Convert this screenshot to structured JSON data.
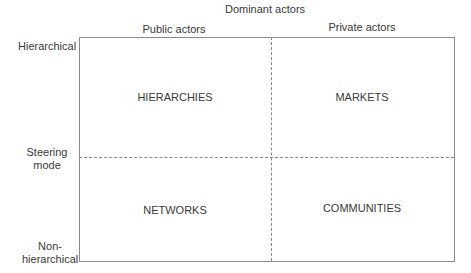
{
  "diagram": {
    "top_title": "Dominant actors",
    "columns": [
      {
        "label": "Public actors"
      },
      {
        "label": "Private actors"
      }
    ],
    "y_axis": {
      "title_line1": "Steering",
      "title_line2": "mode",
      "top": "Hierarchical",
      "bottom_line1": "Non-",
      "bottom_line2": "hierarchical"
    },
    "quadrants": {
      "top_left": "HIERARCHIES",
      "top_right": "MARKETS",
      "bottom_left": "NETWORKS",
      "bottom_right": "COMMUNITIES"
    },
    "colors": {
      "line": "#8a8a8a",
      "text": "#3a3a3a",
      "background": "#ffffff"
    }
  }
}
